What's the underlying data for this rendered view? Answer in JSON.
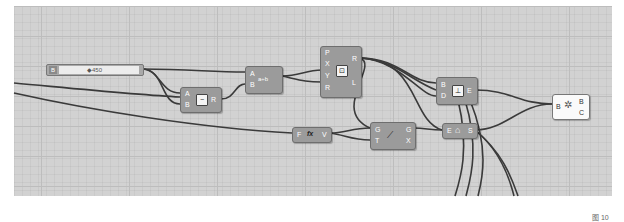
{
  "canvas": {
    "background": "#d2d2d2",
    "grid_color": "#bdbdbd",
    "wire_color": "#3a3a3a"
  },
  "slider": {
    "label": "B",
    "value": "◆450"
  },
  "nodes": {
    "subtract": {
      "inputs": [
        "A",
        "B"
      ],
      "outputs": [
        "R"
      ],
      "icon": "−"
    },
    "division": {
      "inputs": [
        "A",
        "B"
      ],
      "outputs": [
        "R"
      ],
      "icon": "a÷b"
    },
    "point_xyz": {
      "inputs": [
        "P",
        "X",
        "Y",
        "R"
      ],
      "outputs": [
        "R",
        "L"
      ],
      "icon": "⊡"
    },
    "graph_mapper": {
      "inputs": [
        "F"
      ],
      "outputs": [
        "V"
      ],
      "icon": "fx"
    },
    "curve_gx": {
      "inputs": [
        "G",
        "T"
      ],
      "outputs": [
        "G",
        "X"
      ],
      "icon": "⟋"
    },
    "bounds": {
      "inputs": [
        "B",
        "D"
      ],
      "outputs": [
        "E"
      ],
      "icon": "⊥"
    },
    "shape": {
      "inputs": [
        "E"
      ],
      "outputs": [
        "S"
      ],
      "icon": "⌂"
    },
    "panel_bc": {
      "inputs": [
        "B"
      ],
      "outputs": [
        "B",
        "C"
      ],
      "icon": "✲"
    }
  },
  "caption": "图 10"
}
